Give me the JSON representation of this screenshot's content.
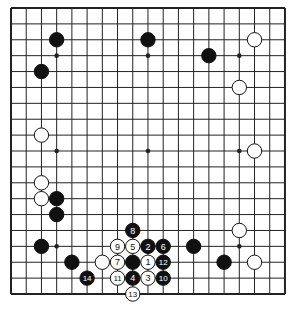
{
  "board": {
    "size": 19,
    "origin": {
      "x": 11,
      "y": 8
    },
    "spacing": {
      "x": 15.22,
      "y": 15.89
    },
    "line_color": "#222222",
    "border_width": 2,
    "stone_radius": 7.2,
    "black_color": "#111111",
    "white_color": "#ffffff",
    "star_points": [
      [
        3,
        3
      ],
      [
        9,
        3
      ],
      [
        15,
        3
      ],
      [
        3,
        9
      ],
      [
        9,
        9
      ],
      [
        15,
        9
      ],
      [
        3,
        15
      ],
      [
        9,
        15
      ],
      [
        15,
        15
      ]
    ]
  },
  "stones": [
    {
      "c": 3,
      "r": 2,
      "color": "black"
    },
    {
      "c": 9,
      "r": 2,
      "color": "black"
    },
    {
      "c": 16,
      "r": 2,
      "color": "white"
    },
    {
      "c": 13,
      "r": 3,
      "color": "black"
    },
    {
      "c": 2,
      "r": 4,
      "color": "black"
    },
    {
      "c": 15,
      "r": 5,
      "color": "white"
    },
    {
      "c": 2,
      "r": 8,
      "color": "white"
    },
    {
      "c": 16,
      "r": 9,
      "color": "white"
    },
    {
      "c": 2,
      "r": 11,
      "color": "white"
    },
    {
      "c": 2,
      "r": 12,
      "color": "white"
    },
    {
      "c": 3,
      "r": 12,
      "color": "black"
    },
    {
      "c": 3,
      "r": 13,
      "color": "black"
    },
    {
      "c": 15,
      "r": 14,
      "color": "white"
    },
    {
      "c": 2,
      "r": 15,
      "color": "black"
    },
    {
      "c": 12,
      "r": 15,
      "color": "black"
    },
    {
      "c": 4,
      "r": 16,
      "color": "black"
    },
    {
      "c": 6,
      "r": 16,
      "color": "white"
    },
    {
      "c": 8,
      "r": 16,
      "color": "black"
    },
    {
      "c": 14,
      "r": 16,
      "color": "black"
    },
    {
      "c": 16,
      "r": 16,
      "color": "white"
    },
    {
      "c": 9,
      "r": 16,
      "color": "white",
      "label": "1"
    },
    {
      "c": 9,
      "r": 15,
      "color": "black",
      "label": "2"
    },
    {
      "c": 9,
      "r": 17,
      "color": "white",
      "label": "3"
    },
    {
      "c": 8,
      "r": 17,
      "color": "black",
      "label": "4"
    },
    {
      "c": 8,
      "r": 15,
      "color": "white",
      "label": "5"
    },
    {
      "c": 10,
      "r": 15,
      "color": "black",
      "label": "6"
    },
    {
      "c": 7,
      "r": 16,
      "color": "white",
      "label": "7"
    },
    {
      "c": 8,
      "r": 14,
      "color": "black",
      "label": "8"
    },
    {
      "c": 7,
      "r": 15,
      "color": "white",
      "label": "9"
    },
    {
      "c": 10,
      "r": 17,
      "color": "black",
      "label": "10"
    },
    {
      "c": 7,
      "r": 17,
      "color": "white",
      "label": "11"
    },
    {
      "c": 10,
      "r": 16,
      "color": "black",
      "label": "12"
    },
    {
      "c": 8,
      "r": 18,
      "color": "white",
      "label": "13"
    },
    {
      "c": 5,
      "r": 17,
      "color": "black",
      "label": "14"
    }
  ]
}
